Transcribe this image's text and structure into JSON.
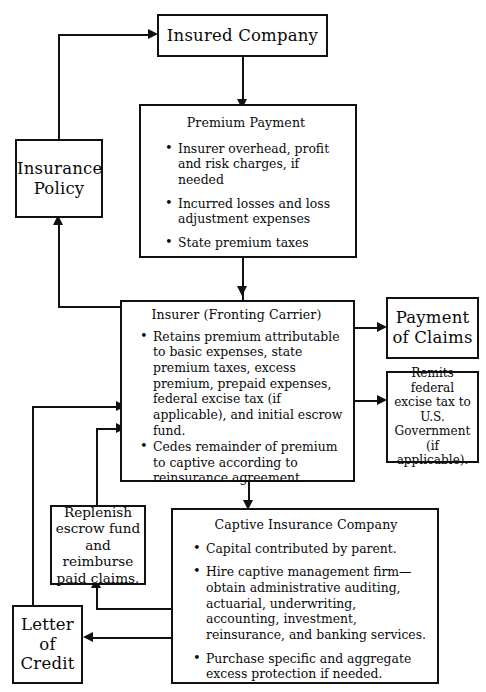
{
  "diagram": {
    "type": "flowchart",
    "nodes": {
      "insured_company": {
        "label": "Insured Company"
      },
      "insurance_policy": {
        "line1": "Insurance",
        "line2": "Policy"
      },
      "premium_payment": {
        "heading": "Premium Payment",
        "bullets": [
          "Insurer overhead, profit and risk charges, if needed",
          "Incurred losses and loss adjustment expenses",
          "State premium taxes"
        ]
      },
      "insurer": {
        "heading": "Insurer (Fronting Carrier)",
        "bullets": [
          "Retains premium attributable to basic expenses, state premium taxes, excess premium, prepaid expenses, federal excise tax (if applicable), and initial escrow fund.",
          "Cedes remainder of premium to captive according to reinsurance agreement."
        ]
      },
      "payment_of_claims": {
        "line1": "Payment",
        "line2": "of Claims"
      },
      "remits_excise_tax": {
        "text": "Remits federal excise tax to U.S. Government (if applicable)."
      },
      "captive": {
        "heading": "Captive Insurance Company",
        "bullets": [
          "Capital contributed by parent.",
          "Hire captive management firm—obtain administrative auditing, actuarial, underwriting, accounting, investment, reinsurance, and banking services.",
          "Purchase specific and aggregate excess protection if needed."
        ]
      },
      "replenish": {
        "text": "Replenish escrow fund and reimburse paid claims."
      },
      "letter_of_credit": {
        "line1": "Letter",
        "line2": "of",
        "line3": "Credit"
      }
    },
    "edges": [
      {
        "from": "insurance_policy",
        "to": "insured_company",
        "name": "policy-to-insured"
      },
      {
        "from": "insured_company",
        "to": "premium_payment",
        "name": "insured-to-premium"
      },
      {
        "from": "premium_payment",
        "to": "insurer",
        "name": "premium-to-insurer"
      },
      {
        "from": "insurer",
        "to": "insurance_policy",
        "name": "insurer-to-policy"
      },
      {
        "from": "insurer",
        "to": "payment_of_claims",
        "name": "insurer-to-claims"
      },
      {
        "from": "insurer",
        "to": "remits_excise_tax",
        "name": "insurer-to-excise"
      },
      {
        "from": "insurer",
        "to": "captive",
        "name": "insurer-to-captive"
      },
      {
        "from": "captive",
        "to": "replenish",
        "name": "captive-to-replenish"
      },
      {
        "from": "captive",
        "to": "letter_of_credit",
        "name": "captive-to-loc"
      },
      {
        "from": "replenish",
        "to": "insurer",
        "name": "replenish-to-insurer"
      },
      {
        "from": "letter_of_credit",
        "to": "insurer",
        "name": "loc-to-insurer"
      }
    ],
    "colors": {
      "ink": "#111111",
      "paper": "#ffffff"
    }
  }
}
